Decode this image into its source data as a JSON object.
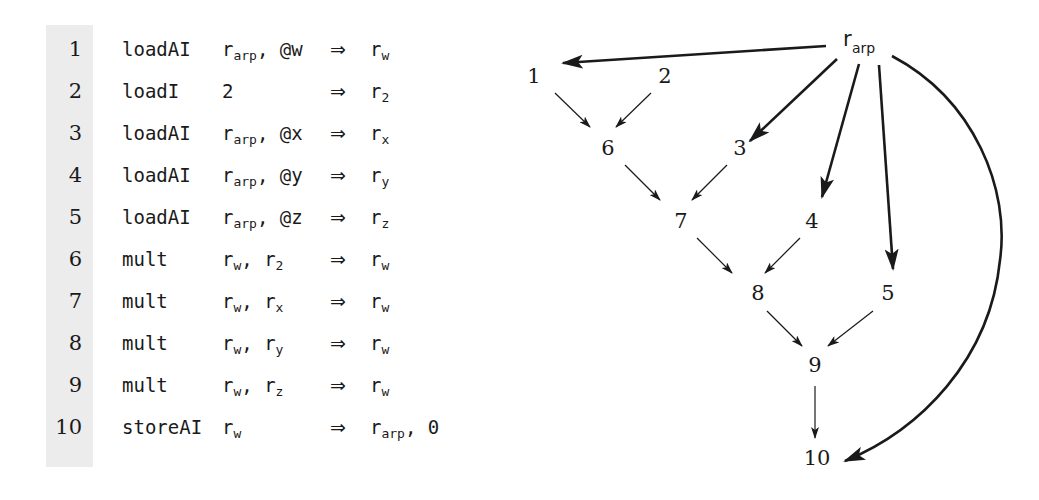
{
  "figure": {
    "code": {
      "rows": [
        {
          "n": "1",
          "op": "loadAI",
          "src_reg": "r",
          "src_sub": "arp",
          "src_rest": ", @w",
          "arrow": "⇒",
          "dst_reg": "r",
          "dst_sub": "w",
          "dst_rest": ""
        },
        {
          "n": "2",
          "op": "loadI",
          "src_reg": "",
          "src_sub": "",
          "src_rest": "2",
          "arrow": "⇒",
          "dst_reg": "r",
          "dst_sub": "2",
          "dst_rest": ""
        },
        {
          "n": "3",
          "op": "loadAI",
          "src_reg": "r",
          "src_sub": "arp",
          "src_rest": ", @x",
          "arrow": "⇒",
          "dst_reg": "r",
          "dst_sub": "x",
          "dst_rest": ""
        },
        {
          "n": "4",
          "op": "loadAI",
          "src_reg": "r",
          "src_sub": "arp",
          "src_rest": ", @y",
          "arrow": "⇒",
          "dst_reg": "r",
          "dst_sub": "y",
          "dst_rest": ""
        },
        {
          "n": "5",
          "op": "loadAI",
          "src_reg": "r",
          "src_sub": "arp",
          "src_rest": ", @z",
          "arrow": "⇒",
          "dst_reg": "r",
          "dst_sub": "z",
          "dst_rest": ""
        },
        {
          "n": "6",
          "op": "mult",
          "src_reg": "r",
          "src_sub": "w",
          "src_rest": ", r",
          "src_sub2": "2",
          "arrow": "⇒",
          "dst_reg": "r",
          "dst_sub": "w",
          "dst_rest": ""
        },
        {
          "n": "7",
          "op": "mult",
          "src_reg": "r",
          "src_sub": "w",
          "src_rest": ", r",
          "src_sub2": "x",
          "arrow": "⇒",
          "dst_reg": "r",
          "dst_sub": "w",
          "dst_rest": ""
        },
        {
          "n": "8",
          "op": "mult",
          "src_reg": "r",
          "src_sub": "w",
          "src_rest": ", r",
          "src_sub2": "y",
          "arrow": "⇒",
          "dst_reg": "r",
          "dst_sub": "w",
          "dst_rest": ""
        },
        {
          "n": "9",
          "op": "mult",
          "src_reg": "r",
          "src_sub": "w",
          "src_rest": ", r",
          "src_sub2": "z",
          "arrow": "⇒",
          "dst_reg": "r",
          "dst_sub": "w",
          "dst_rest": ""
        },
        {
          "n": "10",
          "op": "storeAI",
          "src_reg": "r",
          "src_sub": "w",
          "src_rest": "",
          "arrow": "⇒",
          "dst_reg": "r",
          "dst_sub": "arp",
          "dst_rest": ", 0"
        }
      ]
    },
    "graph": {
      "root": {
        "label": "r",
        "sub": "arp"
      },
      "nodes": [
        {
          "id": "1",
          "label": "1",
          "x": 534,
          "y": 76
        },
        {
          "id": "2",
          "label": "2",
          "x": 665,
          "y": 76
        },
        {
          "id": "6",
          "label": "6",
          "x": 608,
          "y": 148
        },
        {
          "id": "3",
          "label": "3",
          "x": 740,
          "y": 148
        },
        {
          "id": "7",
          "label": "7",
          "x": 681,
          "y": 220
        },
        {
          "id": "4",
          "label": "4",
          "x": 812,
          "y": 220
        },
        {
          "id": "8",
          "label": "8",
          "x": 758,
          "y": 293
        },
        {
          "id": "5",
          "label": "5",
          "x": 888,
          "y": 293
        },
        {
          "id": "9",
          "label": "9",
          "x": 824,
          "y": 365
        },
        {
          "id": "10",
          "label": "10",
          "x": 826,
          "y": 458
        }
      ],
      "edges": [
        {
          "from": "r_arp",
          "to": "1",
          "style": "thick"
        },
        {
          "from": "r_arp",
          "to": "3",
          "style": "thick"
        },
        {
          "from": "r_arp",
          "to": "4",
          "style": "thick"
        },
        {
          "from": "r_arp",
          "to": "5",
          "style": "thick"
        },
        {
          "from": "r_arp",
          "to": "10",
          "style": "thick-curve"
        },
        {
          "from": "1",
          "to": "6",
          "style": "thin"
        },
        {
          "from": "2",
          "to": "6",
          "style": "thin"
        },
        {
          "from": "6",
          "to": "7",
          "style": "thin"
        },
        {
          "from": "3",
          "to": "7",
          "style": "thin"
        },
        {
          "from": "7",
          "to": "8",
          "style": "thin"
        },
        {
          "from": "4",
          "to": "8",
          "style": "thin"
        },
        {
          "from": "8",
          "to": "9",
          "style": "thin"
        },
        {
          "from": "5",
          "to": "9",
          "style": "thin"
        },
        {
          "from": "9",
          "to": "10",
          "style": "thin"
        }
      ]
    },
    "colors": {
      "ink": "#1a1a1a",
      "gutter": "#ececec",
      "background": "#ffffff"
    }
  }
}
